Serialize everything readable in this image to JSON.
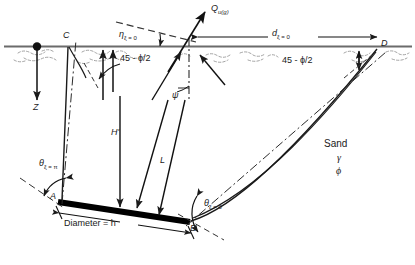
{
  "figure": {
    "title_label": "Uplift capacity of inclined plate anchor in sand",
    "soil": {
      "material": "Sand",
      "unit_weight_symbol": "γ",
      "friction_angle_symbol": "ϕ"
    },
    "points": {
      "A": "A",
      "B": "B",
      "C": "C",
      "D": "D"
    },
    "labels": {
      "depth_axis": "Z",
      "load": "Q",
      "load_sub": "u(g)",
      "eta": "η",
      "eta_sub": "ξ = 0",
      "d_symbol": "d",
      "d_sub": "ξ = 0",
      "theta_pi": "θ",
      "theta_pi_sub": "ξ = π",
      "theta_zero": "θ",
      "theta_zero_sub": "ξ = 0",
      "psi": "ψ",
      "embedment": "H'",
      "anchor_length": "L",
      "diameter": "Diameter = h",
      "wedge_angle_left": "45 - ϕ/2",
      "wedge_angle_right": "45 - ϕ/2"
    },
    "colors": {
      "line": "#1a1a1a",
      "ground": "#555555",
      "anchor": "#000000",
      "hatch": "#8a8a8a",
      "background": "#ffffff"
    },
    "geometry": {
      "ground_line_y": 47,
      "anchor_A": [
        60,
        203
      ],
      "anchor_B": [
        188,
        223
      ],
      "point_C": [
        68,
        45
      ],
      "point_D": [
        378,
        45
      ],
      "load_arrow_tip": [
        210,
        10
      ]
    }
  }
}
